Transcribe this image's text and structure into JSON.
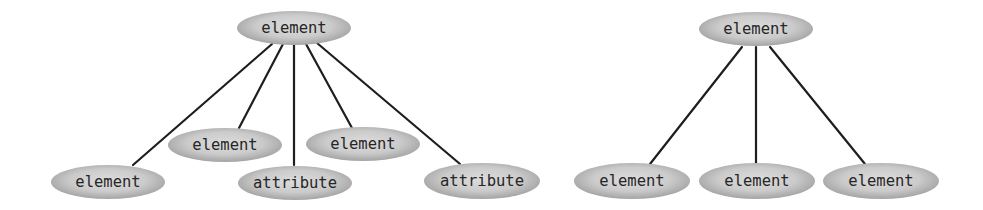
{
  "diagrams": [
    {
      "id": "left-tree",
      "root": {
        "label": "element",
        "cx": 294,
        "cy": 28,
        "rx": 57,
        "ry": 17
      },
      "children": [
        {
          "label": "element",
          "cx": 108,
          "cy": 182,
          "rx": 57,
          "ry": 17,
          "edge_from": [
            272,
            44
          ],
          "edge_to": [
            133,
            165
          ]
        },
        {
          "label": "element",
          "cx": 225,
          "cy": 145,
          "rx": 57,
          "ry": 17,
          "edge_from": [
            283,
            44
          ],
          "edge_to": [
            239,
            128
          ]
        },
        {
          "label": "attribute",
          "cx": 295,
          "cy": 183,
          "rx": 57,
          "ry": 17,
          "edge_from": [
            294,
            45
          ],
          "edge_to": [
            294,
            165
          ]
        },
        {
          "label": "element",
          "cx": 363,
          "cy": 144,
          "rx": 57,
          "ry": 17,
          "edge_from": [
            306,
            44
          ],
          "edge_to": [
            352,
            128
          ]
        },
        {
          "label": "attribute",
          "cx": 482,
          "cy": 181,
          "rx": 58,
          "ry": 18,
          "edge_from": [
            317,
            43
          ],
          "edge_to": [
            460,
            164
          ]
        }
      ]
    },
    {
      "id": "right-tree",
      "root": {
        "label": "element",
        "cx": 756,
        "cy": 29,
        "rx": 57,
        "ry": 17
      },
      "children": [
        {
          "label": "element",
          "cx": 632,
          "cy": 181,
          "rx": 58,
          "ry": 18,
          "edge_from": [
            742,
            47
          ],
          "edge_to": [
            650,
            164
          ]
        },
        {
          "label": "element",
          "cx": 757,
          "cy": 181,
          "rx": 58,
          "ry": 18,
          "edge_from": [
            756,
            47
          ],
          "edge_to": [
            756,
            163
          ]
        },
        {
          "label": "element",
          "cx": 881,
          "cy": 181,
          "rx": 58,
          "ry": 18,
          "edge_from": [
            770,
            47
          ],
          "edge_to": [
            865,
            164
          ]
        }
      ]
    }
  ],
  "colors": {
    "node_center": "#dcdcdc",
    "node_edge": "#a4a4a4",
    "edge_line": "#1e1e1e",
    "text": "#262626"
  }
}
